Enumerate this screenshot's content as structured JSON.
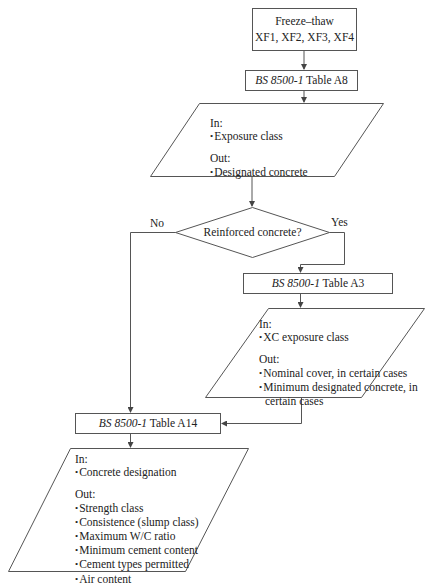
{
  "diagram": {
    "type": "flowchart",
    "colors": {
      "stroke": "#555555",
      "text": "#222222",
      "background": "#ffffff"
    },
    "nodes": {
      "start": {
        "line1": "Freeze–thaw",
        "line2": "XF1, XF2, XF3, XF4"
      },
      "table_a8": {
        "std": "BS 8500-1",
        "rest": " Table A8"
      },
      "io_a8": {
        "in_label": "In:",
        "in_items": [
          "Exposure class"
        ],
        "out_label": "Out:",
        "out_items": [
          "Designated concrete"
        ]
      },
      "decision": {
        "question": "Reinforced concrete?",
        "no_label": "No",
        "yes_label": "Yes"
      },
      "table_a3": {
        "std": "BS 8500-1",
        "rest": " Table A3"
      },
      "io_a3": {
        "in_label": "In:",
        "in_items": [
          "XC exposure class"
        ],
        "out_label": "Out:",
        "out_items": [
          "Nominal cover, in certain cases",
          "Minimum designated concrete, in",
          "certain cases"
        ]
      },
      "table_a14": {
        "std": "BS 8500-1",
        "rest": " Table A14"
      },
      "io_a14": {
        "in_label": "In:",
        "in_items": [
          "Concrete designation"
        ],
        "out_label": "Out:",
        "out_items": [
          "Strength class",
          "Consistence (slump class)",
          "Maximum W/C ratio",
          "Minimum cement content",
          "Cement types permitted",
          "Air content"
        ]
      }
    }
  }
}
